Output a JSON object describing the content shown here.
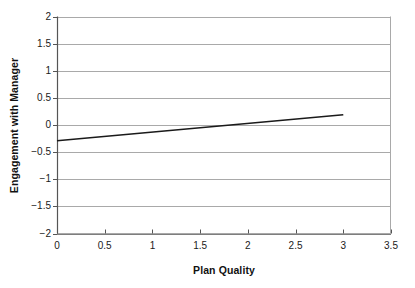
{
  "chart_data": {
    "type": "line",
    "title": "",
    "xlabel": "Plan Quality",
    "ylabel": "Engagement with Manager",
    "xlim": [
      0,
      3.5
    ],
    "ylim": [
      -2,
      2
    ],
    "xticks": [
      "0",
      "0.5",
      "1",
      "1.5",
      "2",
      "2.5",
      "3",
      "3.5"
    ],
    "xtick_values": [
      0,
      0.5,
      1,
      1.5,
      2,
      2.5,
      3,
      3.5
    ],
    "yticks": [
      "2",
      "1.5",
      "1",
      "0.5",
      "0",
      "-0.5",
      "-1",
      "-1.5",
      "-2"
    ],
    "ytick_values": [
      2,
      1.5,
      1,
      0.5,
      0,
      -0.5,
      -1,
      -1.5,
      -2
    ],
    "grid": "horizontal",
    "legend": "none",
    "series": [
      {
        "name": "trend",
        "x": [
          0,
          3
        ],
        "values": [
          -0.29,
          0.19
        ],
        "color": "#1a1a1a",
        "width": 1.6
      }
    ],
    "annotations": []
  },
  "axes": {
    "axis_color": "#555555",
    "grid_color": "#a9a9a9",
    "plot_bg": "#ffffff"
  }
}
